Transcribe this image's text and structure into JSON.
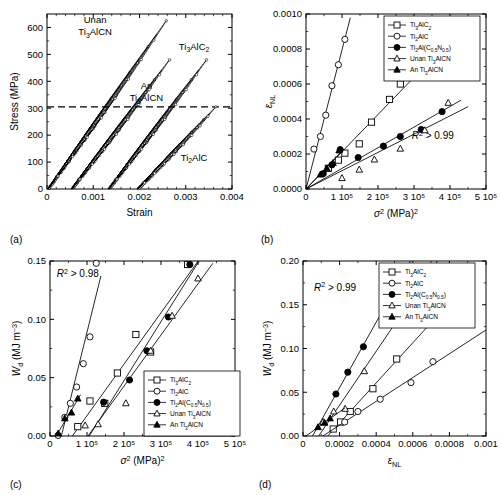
{
  "figure": {
    "panels": [
      "(a)",
      "(b)",
      "(c)",
      "(d)"
    ]
  },
  "chart_data": [
    {
      "panel": "(a)",
      "type": "line",
      "title": "",
      "xlabel": "Strain",
      "ylabel": "Stress (MPa)",
      "xlim": [
        0,
        0.004
      ],
      "ylim": [
        0,
        650
      ],
      "xticks": [
        0,
        0.001,
        0.002,
        0.003,
        0.004
      ],
      "xticklabels": [
        "0",
        "0.001",
        "0.002",
        "0.003",
        "0.004"
      ],
      "yticks": [
        0,
        100,
        200,
        300,
        400,
        500,
        600
      ],
      "yticklabels": [
        "0",
        "100",
        "200",
        "300",
        "400",
        "500",
        "600"
      ],
      "grid": false,
      "legend": "none",
      "annotations": [
        {
          "text": "Unan Ti3AlCN",
          "x": 0.0014,
          "y": 600
        },
        {
          "text": "An Ti3AlCN",
          "x": 0.00205,
          "y": 360
        },
        {
          "text": "Ti3AlC2",
          "x": 0.00305,
          "y": 530
        },
        {
          "text": "Ti2AlC",
          "x": 0.00305,
          "y": 110
        }
      ],
      "dashed_reference_line": {
        "y": 305,
        "label": "305 MPa"
      },
      "loops": [
        {
          "name": "Unan Ti3AlCN",
          "marker": "open-circle",
          "x_start": 2e-05,
          "x_end": 0.00258,
          "stress_max": 625
        },
        {
          "name": "An Ti3AlCN",
          "marker": "open-circle",
          "x_start": 0.00053,
          "x_end": 0.00265,
          "stress_max": 480
        },
        {
          "name": "Ti3AlC2",
          "marker": "open-circle",
          "x_start": 0.00133,
          "x_end": 0.00345,
          "stress_max": 480
        },
        {
          "name": "Ti2AlC",
          "marker": "open-circle",
          "x_start": 0.00196,
          "x_end": 0.00365,
          "stress_max": 305
        }
      ]
    },
    {
      "panel": "(b)",
      "type": "scatter",
      "title": "",
      "xlabel": "sigma^2 (MPa)^2",
      "ylabel": "epsilon_NL",
      "xlim": [
        0,
        500000
      ],
      "ylim": [
        0,
        0.001
      ],
      "xticks": [
        0,
        100000,
        200000,
        300000,
        400000,
        500000
      ],
      "xticklabels": [
        "0",
        "1 10⁵",
        "2 10⁵",
        "3 10⁵",
        "4 10⁵",
        "5 10⁵"
      ],
      "yticks": [
        0,
        0.0002,
        0.0004,
        0.0006,
        0.0008,
        0.001
      ],
      "yticklabels": [
        "0.0000",
        "0.0002",
        "0.0004",
        "0.0006",
        "0.0008",
        "0.0010"
      ],
      "grid": false,
      "legend_position": "upper-right",
      "annotation": "R2 > 0.99",
      "series": [
        {
          "name": "Ti3AlC2",
          "marker": "open-square",
          "x": [
            62000,
            90000,
            108000,
            148000,
            182000,
            232000,
            262000
          ],
          "y": [
            0.000118,
            0.000165,
            0.000205,
            0.000258,
            0.000382,
            0.000512,
            0.0006
          ]
        },
        {
          "name": "Ti2AlC",
          "marker": "open-circle",
          "x": [
            22000,
            40000,
            55000,
            72000,
            90000,
            108000
          ],
          "y": [
            0.000228,
            0.0003,
            0.000422,
            0.00059,
            0.00071,
            0.000855
          ]
        },
        {
          "name": "Ti2Al(C0.5N0.5)",
          "marker": "filled-circle",
          "x": [
            48000,
            72000,
            95000,
            145000,
            215000,
            262000,
            320000,
            378000
          ],
          "y": [
            8.8e-05,
            0.000138,
            0.000225,
            0.00018,
            0.000245,
            0.0003,
            0.00034,
            0.000442
          ]
        },
        {
          "name": "Unan Ti3AlCN",
          "marker": "open-triangle",
          "x": [
            100000,
            148000,
            190000,
            262000,
            330000,
            395000
          ],
          "y": [
            6.2e-05,
            0.00011,
            0.000168,
            0.00023,
            0.000335,
            0.000492
          ]
        },
        {
          "name": "An Ti3AlCN",
          "marker": "filled-triangle",
          "x": [
            40000,
            58000,
            75000,
            92000
          ],
          "y": [
            8.2e-05,
            0.000118,
            0.000148,
            0.00022
          ]
        }
      ]
    },
    {
      "panel": "(c)",
      "type": "scatter",
      "title": "",
      "xlabel": "sigma^2 (MPa)^2",
      "ylabel": "Wd (MJ m^-3)",
      "xlim": [
        0,
        500000
      ],
      "ylim": [
        0,
        0.15
      ],
      "xticks": [
        0,
        100000,
        200000,
        300000,
        400000,
        500000
      ],
      "xticklabels": [
        "0",
        "1 10⁵",
        "2 10⁵",
        "3 10⁵",
        "4 10⁵",
        "5 10⁵"
      ],
      "yticks": [
        0,
        0.05,
        0.1,
        0.15
      ],
      "yticklabels": [
        "0.00",
        "0.05",
        "0.10",
        "0.15"
      ],
      "grid": false,
      "legend_position": "lower-right",
      "annotation": "R2 > 0.98",
      "series": [
        {
          "name": "Ti3AlC2",
          "marker": "open-square",
          "x": [
            75000,
            108000,
            148000,
            182000,
            232000,
            272000,
            372000
          ],
          "y": [
            0.008,
            0.03,
            0.028,
            0.054,
            0.087,
            0.072,
            0.147
          ]
        },
        {
          "name": "Ti2AlC",
          "marker": "open-circle",
          "x": [
            22000,
            40000,
            55000,
            72000,
            90000,
            108000,
            125000
          ],
          "y": [
            0.0005,
            0.016,
            0.028,
            0.042,
            0.062,
            0.085,
            0.148
          ]
        },
        {
          "name": "Ti2Al(C0.5N0.5)",
          "marker": "filled-circle",
          "x": [
            145000,
            215000,
            262000,
            320000,
            378000
          ],
          "y": [
            0.029,
            0.048,
            0.073,
            0.102,
            0.147
          ]
        },
        {
          "name": "Unan Ti3AlCN",
          "marker": "open-triangle",
          "x": [
            95000,
            130000,
            205000,
            272000,
            330000,
            400000
          ],
          "y": [
            0.009,
            0.01,
            0.028,
            0.073,
            0.103,
            0.135
          ]
        },
        {
          "name": "An Ti3AlCN",
          "marker": "filled-triangle",
          "x": [
            22000,
            40000,
            58000,
            75000
          ],
          "y": [
            0.002,
            0.015,
            0.02,
            0.032
          ]
        }
      ]
    },
    {
      "panel": "(d)",
      "type": "scatter",
      "title": "",
      "xlabel": "epsilon_NL",
      "ylabel": "Wd (MJ m^-3)",
      "xlim": [
        0,
        0.001
      ],
      "ylim": [
        0,
        0.2
      ],
      "xticks": [
        0,
        0.0002,
        0.0004,
        0.0006,
        0.0008,
        0.001
      ],
      "xticklabels": [
        "0",
        "0.0002",
        "0.0004",
        "0.0006",
        "0.0008",
        "0.001"
      ],
      "yticks": [
        0,
        0.05,
        0.1,
        0.15,
        0.2
      ],
      "yticklabels": [
        "0.00",
        "0.05",
        "0.10",
        "0.15",
        "0.20"
      ],
      "grid": false,
      "legend_position": "upper-right",
      "annotation": "R2 > 0.99",
      "series": [
        {
          "name": "Ti3AlC2",
          "marker": "open-square",
          "x": [
            0.000165,
            0.000205,
            0.000258,
            0.000382,
            0.000512
          ],
          "y": [
            0.008,
            0.016,
            0.028,
            0.054,
            0.088
          ]
        },
        {
          "name": "Ti2AlC",
          "marker": "open-circle",
          "x": [
            0.000228,
            0.0003,
            0.000422,
            0.00059,
            0.00071
          ],
          "y": [
            0.016,
            0.028,
            0.042,
            0.061,
            0.085
          ]
        },
        {
          "name": "Ti2Al(C0.5N0.5)",
          "marker": "filled-circle",
          "x": [
            0.00018,
            0.000245,
            0.00033,
            0.00044
          ],
          "y": [
            0.048,
            0.073,
            0.102,
            0.146
          ]
        },
        {
          "name": "Unan Ti3AlCN",
          "marker": "open-triangle",
          "x": [
            0.00011,
            0.000168,
            0.00023,
            0.000335,
            0.00051
          ],
          "y": [
            0.016,
            0.028,
            0.031,
            0.074,
            0.136
          ]
        },
        {
          "name": "An Ti3AlCN",
          "marker": "filled-triangle",
          "x": [
            8.2e-05,
            0.000118,
            0.000148
          ],
          "y": [
            0.01,
            0.015,
            0.02
          ]
        }
      ]
    }
  ],
  "legend": {
    "entries": [
      {
        "key": "ti3alc2",
        "marker": "open-square"
      },
      {
        "key": "ti2alc",
        "marker": "open-circle"
      },
      {
        "key": "ti2alcn",
        "marker": "filled-circle"
      },
      {
        "key": "unan",
        "marker": "open-triangle"
      },
      {
        "key": "an",
        "marker": "filled-triangle"
      }
    ]
  },
  "labels": {
    "panel_a": "(a)",
    "panel_b": "(b)",
    "panel_c": "(c)",
    "panel_d": "(d)",
    "strain": "Strain",
    "stress": "Stress (MPa)",
    "r2_099": "R",
    "r2_098": "R",
    "gt099": "> 0.99",
    "gt098": "> 0.98",
    "unan_ti3alcn_1": "Unan",
    "unan_ti3alcn_2": "Ti",
    "unan_ti3alcn_3": "AlCN",
    "an_1": "An",
    "an_2": "Ti",
    "an_3": "AlCN",
    "ti3alc2_lbl_1": "Ti",
    "ti3alc2_lbl_2": "AlC",
    "ti2alc_lbl_1": "Ti",
    "ti2alc_lbl_2": "AlC"
  }
}
